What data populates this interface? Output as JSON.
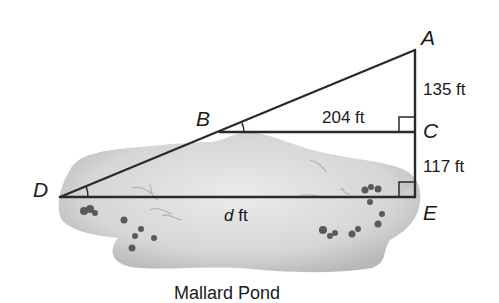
{
  "diagram": {
    "title": "Mallard Pond",
    "points": {
      "A": {
        "label": "A",
        "x": 415,
        "y": 50
      },
      "B": {
        "label": "B",
        "x": 220,
        "y": 132
      },
      "C": {
        "label": "C",
        "x": 415,
        "y": 132
      },
      "D": {
        "label": "D",
        "x": 60,
        "y": 197
      },
      "E": {
        "label": "E",
        "x": 415,
        "y": 197
      }
    },
    "measurements": {
      "AC": "135 ft",
      "BC": "204 ft",
      "CE": "117 ft",
      "DE_var": "d",
      "DE_unit": " ft"
    },
    "right_angles": [
      "C",
      "E"
    ],
    "marked_angles": [
      "B",
      "D"
    ],
    "colors": {
      "line": "#2a2a2a",
      "pond_fill": "#d9d9d9",
      "pond_shadow": "#bdbdbd",
      "rocks": "#555555",
      "text": "#1a1a1a"
    }
  }
}
